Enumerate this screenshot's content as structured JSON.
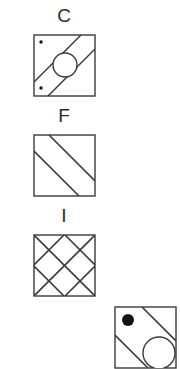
{
  "page": {
    "background_color": "#ffffff",
    "stroke_color": "#3a3a3a",
    "fill_color": "#111111",
    "width": 175,
    "height": 352
  },
  "panels": [
    {
      "id": "c",
      "label": "C",
      "square": {
        "x": 0,
        "y": 0,
        "size": 61
      },
      "shapes": {
        "diagonals": [
          {
            "x1": 0,
            "y1": 47,
            "x2": 47,
            "y2": 0
          },
          {
            "x1": 14,
            "y1": 61,
            "x2": 61,
            "y2": 14
          }
        ],
        "circle": {
          "cx": 31,
          "cy": 30,
          "r": 12
        },
        "dots": [
          {
            "cx": 7,
            "cy": 7,
            "r": 1.6
          },
          {
            "cx": 7,
            "cy": 53,
            "r": 1.6
          }
        ]
      }
    },
    {
      "id": "f",
      "label": "F",
      "square": {
        "x": 0,
        "y": 0,
        "size": 61
      },
      "shapes": {
        "diagonals": [
          {
            "x1": 15,
            "y1": 0,
            "x2": 61,
            "y2": 46
          },
          {
            "x1": 0,
            "y1": 16,
            "x2": 45,
            "y2": 61
          }
        ]
      }
    },
    {
      "id": "i",
      "label": "I",
      "square": {
        "x": 0,
        "y": 0,
        "size": 61
      },
      "shapes": {
        "diagonals": [
          {
            "x1": 0,
            "y1": 30,
            "x2": 30,
            "y2": 0
          },
          {
            "x1": 0,
            "y1": 61,
            "x2": 61,
            "y2": 0
          },
          {
            "x1": 31,
            "y1": 61,
            "x2": 61,
            "y2": 31
          },
          {
            "x1": 0,
            "y1": 31,
            "x2": 30,
            "y2": 61
          },
          {
            "x1": 0,
            "y1": 0,
            "x2": 61,
            "y2": 61
          },
          {
            "x1": 31,
            "y1": 0,
            "x2": 61,
            "y2": 30
          }
        ]
      }
    },
    {
      "id": "partial",
      "label": "",
      "square": {
        "x": 0,
        "y": 0,
        "size": 61
      },
      "shapes": {
        "diagonals": [
          {
            "x1": 27,
            "y1": 0,
            "x2": 61,
            "y2": 34
          },
          {
            "x1": 0,
            "y1": 28,
            "x2": 33,
            "y2": 61
          }
        ],
        "circle": {
          "cx": 44,
          "cy": 46,
          "r": 16
        },
        "dots": [
          {
            "cx": 13,
            "cy": 13,
            "r": 6
          }
        ]
      }
    }
  ]
}
